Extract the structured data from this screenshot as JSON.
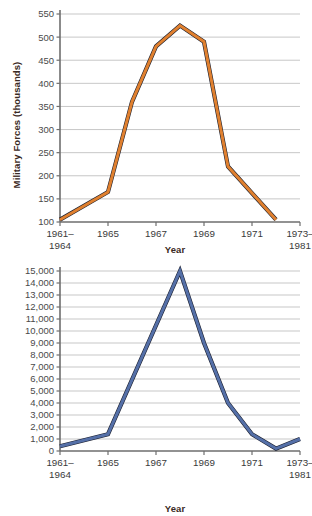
{
  "page": {
    "background": "#ffffff",
    "width": 312,
    "height": 516
  },
  "charts": [
    {
      "id": "military-forces",
      "ylabel": "Military Forces (thousands)",
      "xlabel": "Year"
    },
    {
      "id": "battle-deaths",
      "ylabel": "Battle Deaths",
      "xlabel": "Year"
    }
  ],
  "chart_data": [
    {
      "type": "line",
      "id": "military-forces",
      "title": "",
      "xlabel": "Year",
      "ylabel": "Military Forces (thousands)",
      "line_color": "#E0802F",
      "outline_color": "#1b1f2e",
      "grid": true,
      "legend": "none",
      "ylim": [
        100,
        550
      ],
      "yticks": [
        100,
        150,
        200,
        250,
        300,
        350,
        400,
        450,
        500,
        550
      ],
      "ytick_labels": [
        "100",
        "150",
        "200",
        "250",
        "300",
        "350",
        "400",
        "450",
        "500",
        "550"
      ],
      "xtick_labels": [
        "1961–\n1964",
        "1965",
        "1967",
        "1969",
        "1971",
        "1973–\n1981"
      ],
      "xtick_lines": [
        [
          "1961–",
          "1964"
        ],
        [
          "1965"
        ],
        [
          "1967"
        ],
        [
          "1969"
        ],
        [
          "1971"
        ],
        [
          "1973–",
          "1981"
        ]
      ],
      "xtick_values": [
        1963,
        1965,
        1967,
        1969,
        1971,
        1973
      ],
      "xlim": [
        1963,
        1973
      ],
      "x": [
        1963,
        1965,
        1966,
        1967,
        1968,
        1969,
        1970,
        1972
      ],
      "values": [
        105,
        165,
        360,
        480,
        525,
        490,
        220,
        105
      ]
    },
    {
      "type": "line",
      "id": "battle-deaths",
      "title": "",
      "xlabel": "Year",
      "ylabel": "Battle Deaths",
      "line_color": "#5570A8",
      "outline_color": "#1b1f2e",
      "grid": true,
      "legend": "none",
      "ylim": [
        0,
        15000
      ],
      "yticks": [
        0,
        1000,
        2000,
        3000,
        4000,
        5000,
        6000,
        7000,
        8000,
        9000,
        10000,
        11000,
        12000,
        13000,
        14000,
        15000
      ],
      "ytick_labels": [
        "0",
        "1,000",
        "2,000",
        "3,000",
        "4,000",
        "5,000",
        "6,000",
        "7,000",
        "8,000",
        "9,000",
        "10,000",
        "11,000",
        "12,000",
        "13,000",
        "14,000",
        "15,000"
      ],
      "xtick_labels": [
        "1961–\n1964",
        "1965",
        "1967",
        "1969",
        "1971",
        "1973–\n1981"
      ],
      "xtick_lines": [
        [
          "1961–",
          "1964"
        ],
        [
          "1965"
        ],
        [
          "1967"
        ],
        [
          "1969"
        ],
        [
          "1971"
        ],
        [
          "1973–",
          "1981"
        ]
      ],
      "xtick_values": [
        1963,
        1965,
        1967,
        1969,
        1971,
        1973
      ],
      "xlim": [
        1963,
        1973
      ],
      "x": [
        1963,
        1965,
        1968,
        1969,
        1970,
        1971,
        1972,
        1973
      ],
      "values": [
        400,
        1400,
        15000,
        9000,
        4000,
        1400,
        200,
        1000
      ]
    }
  ]
}
